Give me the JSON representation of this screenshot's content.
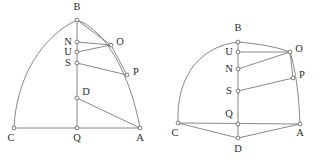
{
  "figure": {
    "background_color": "#ffffff",
    "line_color": "#6b6b6b",
    "label_color": "#2b2b2b",
    "node_fill": "#ffffff",
    "width": 321,
    "height": 166
  },
  "left_diagram": {
    "name": "left-construction",
    "points": {
      "B": {
        "label": "B",
        "x": 77,
        "y": 20,
        "label_x": 77,
        "label_y": 10
      },
      "N": {
        "label": "N",
        "x": 77,
        "y": 42,
        "label_x": 68,
        "label_y": 45
      },
      "U": {
        "label": "U",
        "x": 77,
        "y": 52,
        "label_x": 68,
        "label_y": 55
      },
      "S": {
        "label": "S",
        "x": 77,
        "y": 63,
        "label_x": 68,
        "label_y": 66
      },
      "D": {
        "label": "D",
        "x": 77,
        "y": 98,
        "label_x": 86,
        "label_y": 95
      },
      "Q": {
        "label": "Q",
        "x": 77,
        "y": 128,
        "label_x": 77,
        "label_y": 141
      },
      "C": {
        "label": "C",
        "x": 14,
        "y": 128,
        "label_x": 11,
        "label_y": 141
      },
      "A": {
        "label": "A",
        "x": 140,
        "y": 128,
        "label_x": 140,
        "label_y": 141
      },
      "O": {
        "label": "O",
        "x": 111,
        "y": 45,
        "label_x": 120,
        "label_y": 45
      },
      "P": {
        "label": "P",
        "x": 127,
        "y": 75,
        "label_x": 136,
        "label_y": 75
      }
    },
    "segments": [
      {
        "name": "segment-B-Q",
        "from": "B",
        "to": "Q"
      },
      {
        "name": "segment-C-A",
        "from": "C",
        "to": "A"
      },
      {
        "name": "segment-B-O",
        "from": "B",
        "to": "O"
      },
      {
        "name": "segment-N-O",
        "from": "N",
        "to": "O"
      },
      {
        "name": "segment-U-O",
        "from": "U",
        "to": "O"
      },
      {
        "name": "segment-S-P",
        "from": "S",
        "to": "P"
      },
      {
        "name": "segment-O-P",
        "from": "O",
        "to": "P"
      },
      {
        "name": "segment-D-A",
        "from": "D",
        "to": "A"
      }
    ],
    "arcs": [
      {
        "name": "arc-C-B",
        "d": "M 14 128 C 16 78 42 36 77 20"
      },
      {
        "name": "arc-B-A",
        "d": "M 77 20 C 106 30 130 74 140 128"
      }
    ]
  },
  "right_diagram": {
    "name": "right-construction",
    "points": {
      "B": {
        "label": "B",
        "x": 238,
        "y": 42,
        "label_x": 238,
        "label_y": 31
      },
      "U": {
        "label": "U",
        "x": 238,
        "y": 52,
        "label_x": 229,
        "label_y": 55
      },
      "N": {
        "label": "N",
        "x": 238,
        "y": 69,
        "label_x": 229,
        "label_y": 72
      },
      "S": {
        "label": "S",
        "x": 238,
        "y": 91,
        "label_x": 229,
        "label_y": 94
      },
      "Q": {
        "label": "Q",
        "x": 238,
        "y": 124,
        "label_x": 229,
        "label_y": 117
      },
      "C": {
        "label": "C",
        "x": 178,
        "y": 123,
        "label_x": 175,
        "label_y": 136
      },
      "A": {
        "label": "A",
        "x": 300,
        "y": 124,
        "label_x": 300,
        "label_y": 136
      },
      "D": {
        "label": "D",
        "x": 238,
        "y": 138,
        "label_x": 238,
        "label_y": 152
      },
      "O": {
        "label": "O",
        "x": 290,
        "y": 52,
        "label_x": 299,
        "label_y": 52
      },
      "P": {
        "label": "P",
        "x": 293,
        "y": 78,
        "label_x": 302,
        "label_y": 78
      }
    },
    "segments": [
      {
        "name": "segment-B-D",
        "from": "B",
        "to": "D"
      },
      {
        "name": "segment-C-A",
        "from": "C",
        "to": "A"
      },
      {
        "name": "segment-C-D",
        "from": "C",
        "to": "D"
      },
      {
        "name": "segment-D-A",
        "from": "D",
        "to": "A"
      },
      {
        "name": "segment-U-O",
        "from": "U",
        "to": "O"
      },
      {
        "name": "segment-N-O",
        "from": "N",
        "to": "O"
      },
      {
        "name": "segment-S-P",
        "from": "S",
        "to": "P"
      },
      {
        "name": "segment-O-P",
        "from": "O",
        "to": "P"
      }
    ],
    "arcs": [
      {
        "name": "arc-C-B",
        "d": "M 178 123 C 176 74 202 46 238 42"
      },
      {
        "name": "arc-B-O",
        "d": "M 238 42 C 262 44 280 48 290 52"
      },
      {
        "name": "arc-O-A",
        "d": "M 290 52 C 296 70 299 98 300 124"
      }
    ]
  }
}
